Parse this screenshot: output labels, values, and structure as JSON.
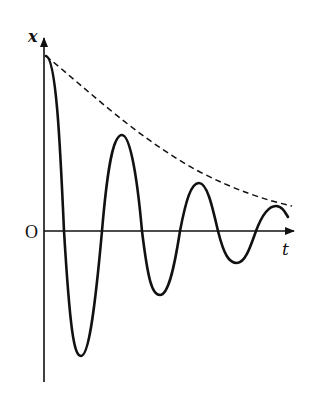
{
  "diagram": {
    "axes": {
      "y_label": "x",
      "x_label": "t",
      "origin_label": "O"
    },
    "curves": [
      {
        "name": "displacement",
        "style": "solid",
        "description": "damped sinusoidal oscillation"
      },
      {
        "name": "envelope",
        "style": "dashed",
        "description": "exponential decay envelope of amplitude"
      }
    ],
    "stroke_color": "#111111",
    "background": "#ffffff"
  }
}
